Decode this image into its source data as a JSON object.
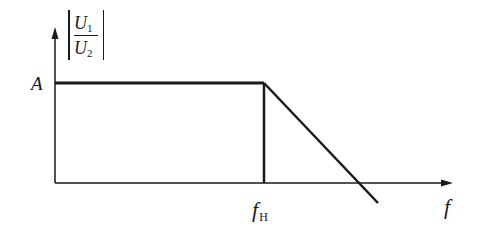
{
  "diagram": {
    "type": "frequency-response-plot",
    "y_axis": {
      "label_numerator": "U",
      "label_numerator_sub": "1",
      "label_denominator": "U",
      "label_denominator_sub": "2",
      "label_style": "absolute-value ratio |U1/U2|"
    },
    "x_axis": {
      "label": "f"
    },
    "level_label": "A",
    "cutoff_label": "f",
    "cutoff_label_sub": "H",
    "colors": {
      "line": "#1a1a1a",
      "background": "#ffffff"
    },
    "geometry": {
      "origin": [
        55,
        183
      ],
      "y_axis_top": [
        55,
        28
      ],
      "x_axis_end": [
        452,
        183
      ],
      "plateau_start": [
        55,
        83
      ],
      "corner": [
        264,
        83
      ],
      "rolloff_end": [
        378,
        203
      ]
    }
  }
}
